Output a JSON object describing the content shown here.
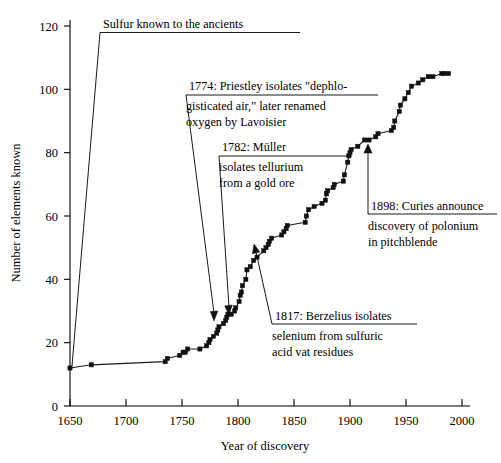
{
  "chart_data": {
    "type": "line",
    "title": "",
    "xlabel": "Year of discovery",
    "ylabel": "Number of elements known",
    "xlim": [
      1650,
      2000
    ],
    "ylim": [
      0,
      125
    ],
    "xticks": [
      1650,
      1700,
      1750,
      1800,
      1850,
      1900,
      1950,
      2000
    ],
    "xtick_labels": [
      "1650",
      "1700",
      "1750",
      "1800",
      "1850",
      "1900",
      "1950",
      "2000"
    ],
    "yticks": [
      0,
      20,
      40,
      60,
      80,
      100,
      120
    ],
    "ytick_labels": [
      "0",
      "20",
      "40",
      "60",
      "80",
      "100",
      "120"
    ],
    "grid": false,
    "legend": "none",
    "marker": "filled-square",
    "series": [
      {
        "name": "Cumulative elements known",
        "x": [
          1650,
          1669,
          1735,
          1737,
          1748,
          1751,
          1753,
          1755,
          1766,
          1772,
          1774,
          1775,
          1778,
          1781,
          1782,
          1783,
          1787,
          1789,
          1790,
          1791,
          1794,
          1797,
          1798,
          1801,
          1802,
          1803,
          1804,
          1807,
          1808,
          1811,
          1814,
          1817,
          1823,
          1825,
          1827,
          1828,
          1830,
          1839,
          1841,
          1843,
          1844,
          1860,
          1861,
          1863,
          1868,
          1875,
          1878,
          1879,
          1880,
          1885,
          1886,
          1894,
          1895,
          1898,
          1899,
          1900,
          1901,
          1907,
          1913,
          1917,
          1923,
          1925,
          1937,
          1939,
          1940,
          1944,
          1945,
          1949,
          1952,
          1955,
          1961,
          1965,
          1970,
          1974,
          1982,
          1984,
          1988
        ],
        "y": [
          12,
          13,
          14,
          15,
          16,
          17,
          17,
          18,
          18,
          19,
          20,
          21,
          22,
          23,
          24,
          25,
          26,
          27,
          28,
          29,
          29,
          30,
          31,
          33,
          35,
          36,
          38,
          40,
          43,
          44,
          46,
          47,
          49,
          50,
          51,
          52,
          53,
          54,
          55,
          56,
          57,
          58,
          60,
          62,
          63,
          64,
          65,
          67,
          68,
          69,
          70,
          71,
          73,
          77,
          79,
          80,
          81,
          82,
          84,
          84,
          85,
          86,
          87,
          88,
          90,
          93,
          95,
          97,
          99,
          101,
          102,
          103,
          104,
          104,
          105,
          105,
          105
        ]
      }
    ],
    "annotations": [
      {
        "id": "sulfur",
        "lines": [
          "Sulfur known to the ancients"
        ],
        "points_to_year": 1650,
        "points_to_value": 12
      },
      {
        "id": "priestley",
        "lines": [
          "1774: Priestley isolates \"dephlo-",
          "gisticated air,\" later renamed",
          "oxygen by Lavoisier"
        ],
        "points_to_year": 1774,
        "points_to_value": 20
      },
      {
        "id": "muller",
        "lines": [
          "1782: Müller",
          "isolates tellurium",
          "from a gold ore"
        ],
        "points_to_year": 1782,
        "points_to_value": 24
      },
      {
        "id": "berzelius",
        "lines": [
          "1817: Berzelius isolates",
          "selenium from sulfuric",
          "acid vat residues"
        ],
        "points_to_year": 1817,
        "points_to_value": 47
      },
      {
        "id": "curies",
        "lines": [
          "1898: Curies announce",
          "discovery of polonium",
          "in pitchblende"
        ],
        "points_to_year": 1898,
        "points_to_value": 77
      }
    ]
  }
}
